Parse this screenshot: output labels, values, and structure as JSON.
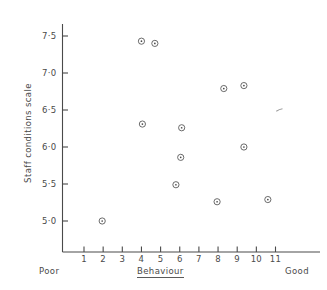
{
  "chart_data": {
    "type": "scatter",
    "title": "",
    "xlabel": "Behaviour",
    "ylabel": "Staff conditions scale",
    "xlim": [
      0.35,
      11.95
    ],
    "ylim": [
      4.74,
      7.63
    ],
    "grid": false,
    "legend": null,
    "x_axis_endpoint_labels": {
      "left": "Poor",
      "right": "Good"
    },
    "xticks": [
      1,
      2,
      3,
      4,
      5,
      6,
      7,
      8,
      9,
      10,
      11
    ],
    "xtick_labels": [
      "1",
      "2",
      "3",
      "4",
      "5",
      "6",
      "7",
      "8",
      "9",
      "10",
      "11"
    ],
    "yticks": [
      5.0,
      5.5,
      6.0,
      6.5,
      7.0,
      7.5
    ],
    "ytick_labels": [
      "5·0",
      "5·5",
      "6·0",
      "6·5",
      "7·0",
      "7·5"
    ],
    "marker": "circle-with-dot",
    "points": [
      {
        "x": 4.0,
        "y": 7.43
      },
      {
        "x": 4.7,
        "y": 7.4
      },
      {
        "x": 8.3,
        "y": 6.79
      },
      {
        "x": 9.35,
        "y": 6.83
      },
      {
        "x": 4.05,
        "y": 6.31
      },
      {
        "x": 6.1,
        "y": 6.26
      },
      {
        "x": 9.35,
        "y": 6.0
      },
      {
        "x": 6.05,
        "y": 5.86
      },
      {
        "x": 5.8,
        "y": 5.49
      },
      {
        "x": 7.95,
        "y": 5.26
      },
      {
        "x": 10.6,
        "y": 5.29
      },
      {
        "x": 1.95,
        "y": 5.0
      }
    ],
    "faint_mark": {
      "x": 11.25,
      "y": 6.5
    }
  },
  "axes": {
    "y_axis_label": "Staff conditions scale",
    "x_axis_label": "Behaviour",
    "left_end_label": "Poor",
    "right_end_label": "Good"
  }
}
